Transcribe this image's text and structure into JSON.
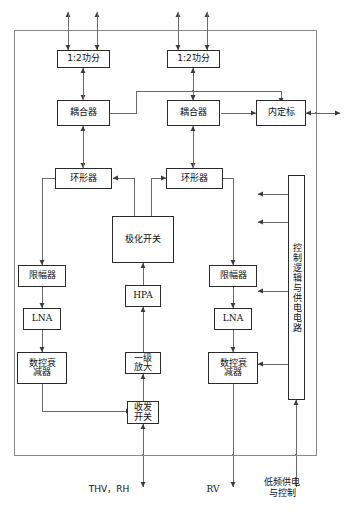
{
  "diagram": {
    "frame": {
      "label": "outer-enclosure"
    },
    "blocks": [
      {
        "id": "div1",
        "label": "1:2功分",
        "script": "cn"
      },
      {
        "id": "div2",
        "label": "1:2功分",
        "script": "cn"
      },
      {
        "id": "cpl1",
        "label": "耦合器",
        "script": "cn"
      },
      {
        "id": "cpl2",
        "label": "耦合器",
        "script": "cn"
      },
      {
        "id": "cal",
        "label": "内定标",
        "script": "cn"
      },
      {
        "id": "circ1",
        "label": "环形器",
        "script": "cn"
      },
      {
        "id": "circ2",
        "label": "环形器",
        "script": "cn"
      },
      {
        "id": "polsw",
        "label": "极化开关",
        "script": "cn"
      },
      {
        "id": "lim1",
        "label": "限幅器",
        "script": "cn"
      },
      {
        "id": "lim2",
        "label": "限幅器",
        "script": "cn"
      },
      {
        "id": "lna1",
        "label": "LNA",
        "script": "lat"
      },
      {
        "id": "lna2",
        "label": "LNA",
        "script": "lat"
      },
      {
        "id": "att1",
        "label": "数控衰\n减器",
        "script": "cn"
      },
      {
        "id": "att2",
        "label": "数控衰\n减器",
        "script": "cn"
      },
      {
        "id": "hpa",
        "label": "HPA",
        "script": "lat"
      },
      {
        "id": "preamp",
        "label": "一级\n放大",
        "script": "cn"
      },
      {
        "id": "trsw",
        "label": "收发\n开关",
        "script": "cn"
      },
      {
        "id": "ctrl",
        "label": "控制逻辑与供电电路",
        "script": "cn"
      }
    ],
    "port_labels": [
      {
        "id": "port-thv-rh",
        "label": "THV，RH",
        "script": "cn"
      },
      {
        "id": "port-rv",
        "label": "RV",
        "script": "lat"
      },
      {
        "id": "port-power",
        "label": "低频供电\n与控制",
        "script": "cn"
      }
    ],
    "colors": {
      "line": "#555555",
      "box_border": "#2b2b2b",
      "text": "#111111",
      "background": "#ffffff"
    }
  }
}
